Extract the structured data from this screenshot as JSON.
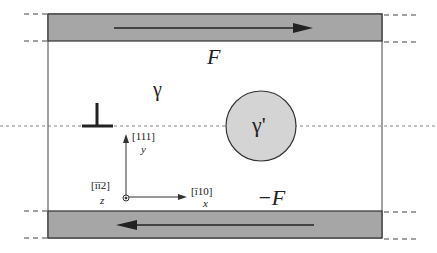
{
  "diagram": {
    "type": "dislocation-precipitate shear cell",
    "labels": {
      "top_force": "F",
      "bottom_force": "−F",
      "matrix_phase": "γ",
      "precipitate_phase": "γ'",
      "y_direction": "[111]",
      "y_axis": "y",
      "z_direction": "[īī2]",
      "z_axis": "z",
      "x_direction": "[ī10]",
      "x_axis": "x"
    },
    "colors": {
      "slab_fill": "#a6a6a6",
      "precipitate_fill": "#d4d4d4",
      "line": "#333333",
      "background": "#ffffff"
    },
    "elements": {
      "top_slab_arrow": "right",
      "bottom_slab_arrow": "left",
      "dislocation_symbol": "edge-dislocation"
    }
  }
}
